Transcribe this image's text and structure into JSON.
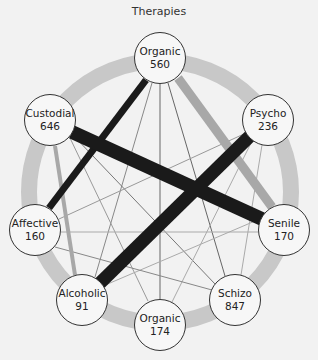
{
  "title": "Therapies",
  "colors": {
    "background": "#f2f2f2",
    "ring": "#c8c8c8",
    "strong_edge": "#1a1a1a",
    "medium_edge": "#a8a8a8",
    "thin_edge_dark": "#666666",
    "thin_edge_light": "#b0b0b0",
    "node_fill": "#f7f7f7",
    "node_stroke": "#333333"
  },
  "nodes": [
    {
      "id": "organic_top",
      "label": "Organic",
      "value": "560",
      "x": 160,
      "y": 58
    },
    {
      "id": "psycho",
      "label": "Psycho",
      "value": "236",
      "x": 268,
      "y": 120
    },
    {
      "id": "senile",
      "label": "Senile",
      "value": "170",
      "x": 284,
      "y": 230
    },
    {
      "id": "schizo",
      "label": "Schizo",
      "value": "847",
      "x": 235,
      "y": 300
    },
    {
      "id": "organic_bottom",
      "label": "Organic",
      "value": "174",
      "x": 160,
      "y": 325
    },
    {
      "id": "alcoholic",
      "label": "Alcoholic",
      "value": "91",
      "x": 82,
      "y": 300
    },
    {
      "id": "affective",
      "label": "Affective",
      "value": "160",
      "x": 35,
      "y": 230
    },
    {
      "id": "custodial",
      "label": "Custodial",
      "value": "646",
      "x": 50,
      "y": 120
    }
  ],
  "edges": [
    {
      "from": "custodial",
      "to": "senile",
      "weight": "heavy"
    },
    {
      "from": "psycho",
      "to": "alcoholic",
      "weight": "heavy"
    },
    {
      "from": "organic_top",
      "to": "affective",
      "weight": "strong"
    },
    {
      "from": "organic_top",
      "to": "senile",
      "weight": "medium"
    },
    {
      "from": "custodial",
      "to": "alcoholic",
      "weight": "medium"
    },
    {
      "from": "organic_top",
      "to": "organic_bottom",
      "weight": "thin"
    },
    {
      "from": "organic_top",
      "to": "alcoholic",
      "weight": "thin"
    },
    {
      "from": "organic_top",
      "to": "schizo",
      "weight": "thin"
    },
    {
      "from": "custodial",
      "to": "organic_bottom",
      "weight": "thin"
    },
    {
      "from": "custodial",
      "to": "schizo",
      "weight": "thin"
    },
    {
      "from": "psycho",
      "to": "affective",
      "weight": "thin"
    },
    {
      "from": "psycho",
      "to": "organic_bottom",
      "weight": "thin"
    },
    {
      "from": "psycho",
      "to": "schizo",
      "weight": "thin"
    },
    {
      "from": "senile",
      "to": "alcoholic",
      "weight": "thin"
    },
    {
      "from": "affective",
      "to": "schizo",
      "weight": "thin"
    },
    {
      "from": "affective",
      "to": "senile",
      "weight": "thin"
    }
  ]
}
